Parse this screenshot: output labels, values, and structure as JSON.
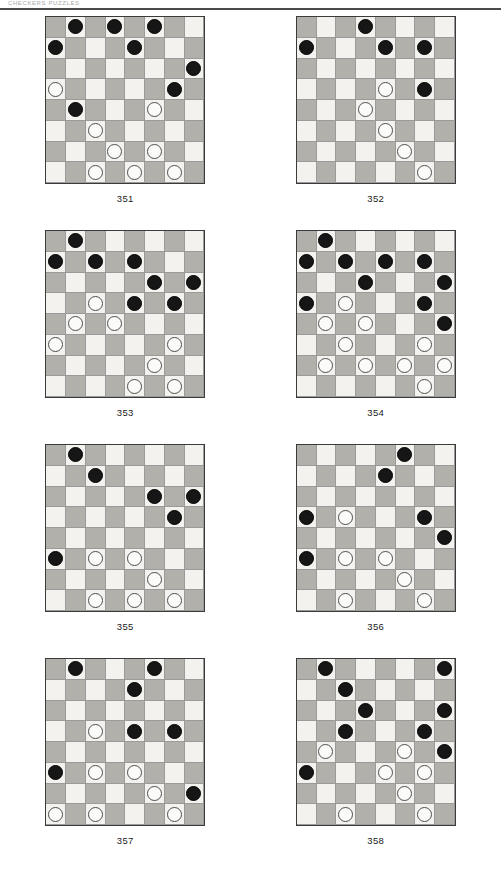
{
  "header": {
    "running_head": "CHECKERS PUZZLES"
  },
  "board_size": 8,
  "legend": {
    "black_piece": "black-checker",
    "white_piece": "white-checker",
    "dark_square_color": "#b2b0ab",
    "light_square_color": "#f4f2ee"
  },
  "diagrams": [
    {
      "caption": "351",
      "pieces": [
        {
          "row": 1,
          "col": 2,
          "color": "b"
        },
        {
          "row": 1,
          "col": 4,
          "color": "b"
        },
        {
          "row": 1,
          "col": 6,
          "color": "b"
        },
        {
          "row": 2,
          "col": 1,
          "color": "b"
        },
        {
          "row": 2,
          "col": 5,
          "color": "b"
        },
        {
          "row": 3,
          "col": 8,
          "color": "b"
        },
        {
          "row": 4,
          "col": 1,
          "color": "w"
        },
        {
          "row": 4,
          "col": 7,
          "color": "b"
        },
        {
          "row": 5,
          "col": 2,
          "color": "b"
        },
        {
          "row": 5,
          "col": 6,
          "color": "w"
        },
        {
          "row": 6,
          "col": 3,
          "color": "w"
        },
        {
          "row": 7,
          "col": 4,
          "color": "w"
        },
        {
          "row": 7,
          "col": 6,
          "color": "w"
        },
        {
          "row": 8,
          "col": 3,
          "color": "w"
        },
        {
          "row": 8,
          "col": 5,
          "color": "w"
        },
        {
          "row": 8,
          "col": 7,
          "color": "w"
        }
      ]
    },
    {
      "caption": "352",
      "pieces": [
        {
          "row": 1,
          "col": 4,
          "color": "b"
        },
        {
          "row": 2,
          "col": 1,
          "color": "b"
        },
        {
          "row": 2,
          "col": 5,
          "color": "b"
        },
        {
          "row": 2,
          "col": 7,
          "color": "b"
        },
        {
          "row": 4,
          "col": 5,
          "color": "w"
        },
        {
          "row": 4,
          "col": 7,
          "color": "b"
        },
        {
          "row": 5,
          "col": 4,
          "color": "w"
        },
        {
          "row": 6,
          "col": 5,
          "color": "w"
        },
        {
          "row": 7,
          "col": 6,
          "color": "w"
        },
        {
          "row": 8,
          "col": 7,
          "color": "w"
        }
      ]
    },
    {
      "caption": "353",
      "pieces": [
        {
          "row": 1,
          "col": 2,
          "color": "b"
        },
        {
          "row": 2,
          "col": 1,
          "color": "b"
        },
        {
          "row": 2,
          "col": 3,
          "color": "b"
        },
        {
          "row": 2,
          "col": 5,
          "color": "b"
        },
        {
          "row": 3,
          "col": 6,
          "color": "b"
        },
        {
          "row": 3,
          "col": 8,
          "color": "b"
        },
        {
          "row": 4,
          "col": 3,
          "color": "w"
        },
        {
          "row": 4,
          "col": 5,
          "color": "b"
        },
        {
          "row": 4,
          "col": 7,
          "color": "b"
        },
        {
          "row": 5,
          "col": 2,
          "color": "w"
        },
        {
          "row": 5,
          "col": 4,
          "color": "w"
        },
        {
          "row": 6,
          "col": 1,
          "color": "w"
        },
        {
          "row": 6,
          "col": 7,
          "color": "w"
        },
        {
          "row": 7,
          "col": 6,
          "color": "w"
        },
        {
          "row": 8,
          "col": 5,
          "color": "w"
        },
        {
          "row": 8,
          "col": 7,
          "color": "w"
        }
      ]
    },
    {
      "caption": "354",
      "pieces": [
        {
          "row": 1,
          "col": 2,
          "color": "b"
        },
        {
          "row": 2,
          "col": 1,
          "color": "b"
        },
        {
          "row": 2,
          "col": 3,
          "color": "b"
        },
        {
          "row": 2,
          "col": 5,
          "color": "b"
        },
        {
          "row": 2,
          "col": 7,
          "color": "b"
        },
        {
          "row": 3,
          "col": 4,
          "color": "b"
        },
        {
          "row": 3,
          "col": 8,
          "color": "b"
        },
        {
          "row": 4,
          "col": 1,
          "color": "b"
        },
        {
          "row": 4,
          "col": 3,
          "color": "w"
        },
        {
          "row": 4,
          "col": 7,
          "color": "b"
        },
        {
          "row": 5,
          "col": 2,
          "color": "w"
        },
        {
          "row": 5,
          "col": 4,
          "color": "w"
        },
        {
          "row": 5,
          "col": 8,
          "color": "b"
        },
        {
          "row": 6,
          "col": 3,
          "color": "w"
        },
        {
          "row": 6,
          "col": 7,
          "color": "w"
        },
        {
          "row": 7,
          "col": 2,
          "color": "w"
        },
        {
          "row": 7,
          "col": 4,
          "color": "w"
        },
        {
          "row": 7,
          "col": 6,
          "color": "w"
        },
        {
          "row": 7,
          "col": 8,
          "color": "w"
        },
        {
          "row": 8,
          "col": 7,
          "color": "w"
        }
      ]
    },
    {
      "caption": "355",
      "pieces": [
        {
          "row": 1,
          "col": 2,
          "color": "b"
        },
        {
          "row": 2,
          "col": 3,
          "color": "b"
        },
        {
          "row": 3,
          "col": 6,
          "color": "b"
        },
        {
          "row": 3,
          "col": 8,
          "color": "b"
        },
        {
          "row": 4,
          "col": 7,
          "color": "b"
        },
        {
          "row": 6,
          "col": 1,
          "color": "b"
        },
        {
          "row": 6,
          "col": 3,
          "color": "w"
        },
        {
          "row": 6,
          "col": 5,
          "color": "w"
        },
        {
          "row": 7,
          "col": 6,
          "color": "w"
        },
        {
          "row": 8,
          "col": 3,
          "color": "w"
        },
        {
          "row": 8,
          "col": 5,
          "color": "w"
        },
        {
          "row": 8,
          "col": 7,
          "color": "w"
        }
      ]
    },
    {
      "caption": "356",
      "pieces": [
        {
          "row": 1,
          "col": 6,
          "color": "b"
        },
        {
          "row": 2,
          "col": 5,
          "color": "b"
        },
        {
          "row": 4,
          "col": 1,
          "color": "b"
        },
        {
          "row": 4,
          "col": 3,
          "color": "w"
        },
        {
          "row": 4,
          "col": 7,
          "color": "b"
        },
        {
          "row": 5,
          "col": 8,
          "color": "b"
        },
        {
          "row": 6,
          "col": 1,
          "color": "b"
        },
        {
          "row": 6,
          "col": 3,
          "color": "w"
        },
        {
          "row": 6,
          "col": 5,
          "color": "w"
        },
        {
          "row": 7,
          "col": 6,
          "color": "w"
        },
        {
          "row": 8,
          "col": 3,
          "color": "w"
        },
        {
          "row": 8,
          "col": 7,
          "color": "w"
        }
      ]
    },
    {
      "caption": "357",
      "pieces": [
        {
          "row": 1,
          "col": 2,
          "color": "b"
        },
        {
          "row": 1,
          "col": 6,
          "color": "b"
        },
        {
          "row": 2,
          "col": 5,
          "color": "b"
        },
        {
          "row": 4,
          "col": 3,
          "color": "w"
        },
        {
          "row": 4,
          "col": 5,
          "color": "b"
        },
        {
          "row": 4,
          "col": 7,
          "color": "b"
        },
        {
          "row": 6,
          "col": 1,
          "color": "b"
        },
        {
          "row": 6,
          "col": 3,
          "color": "w"
        },
        {
          "row": 6,
          "col": 5,
          "color": "w"
        },
        {
          "row": 7,
          "col": 6,
          "color": "w"
        },
        {
          "row": 7,
          "col": 8,
          "color": "b"
        },
        {
          "row": 8,
          "col": 1,
          "color": "w"
        },
        {
          "row": 8,
          "col": 3,
          "color": "w"
        },
        {
          "row": 8,
          "col": 7,
          "color": "w"
        }
      ]
    },
    {
      "caption": "358",
      "pieces": [
        {
          "row": 1,
          "col": 2,
          "color": "b"
        },
        {
          "row": 1,
          "col": 8,
          "color": "b"
        },
        {
          "row": 2,
          "col": 3,
          "color": "b"
        },
        {
          "row": 3,
          "col": 4,
          "color": "b"
        },
        {
          "row": 3,
          "col": 8,
          "color": "b"
        },
        {
          "row": 4,
          "col": 3,
          "color": "b"
        },
        {
          "row": 4,
          "col": 7,
          "color": "b"
        },
        {
          "row": 5,
          "col": 2,
          "color": "w"
        },
        {
          "row": 5,
          "col": 6,
          "color": "w"
        },
        {
          "row": 5,
          "col": 8,
          "color": "b"
        },
        {
          "row": 6,
          "col": 1,
          "color": "b"
        },
        {
          "row": 6,
          "col": 5,
          "color": "w"
        },
        {
          "row": 6,
          "col": 7,
          "color": "w"
        },
        {
          "row": 7,
          "col": 6,
          "color": "w"
        },
        {
          "row": 8,
          "col": 3,
          "color": "w"
        },
        {
          "row": 8,
          "col": 7,
          "color": "w"
        }
      ]
    }
  ]
}
